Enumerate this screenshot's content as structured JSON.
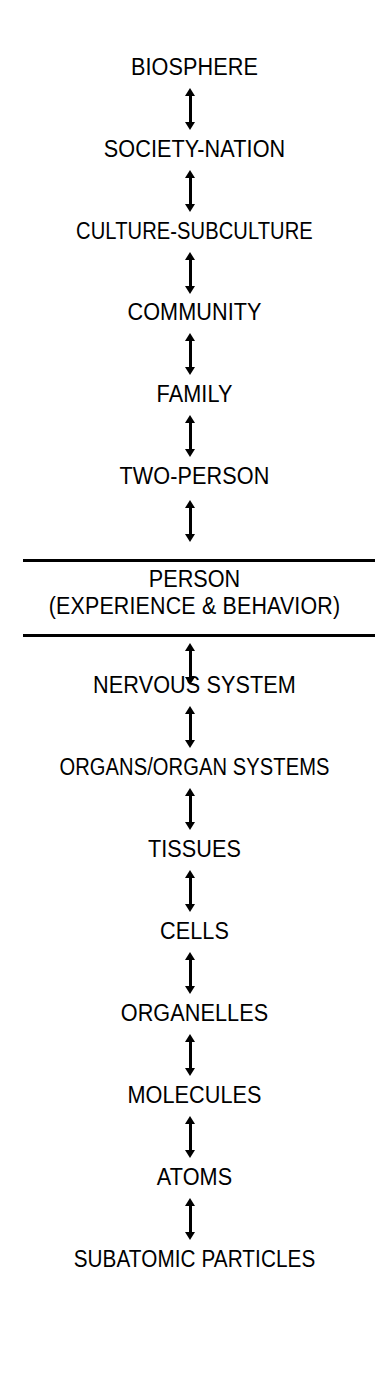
{
  "diagram": {
    "background_color": "#ffffff",
    "ink_color": "#000000",
    "orientation": "vertical",
    "connector": "double-headed-arrow",
    "levels": [
      {
        "id": "biosphere",
        "label": "BIOSPHERE",
        "tier": "supra-personal",
        "rank": 1,
        "top": 54
      },
      {
        "id": "society-nation",
        "label": "SOCIETY-NATION",
        "tier": "supra-personal",
        "rank": 2,
        "top": 136
      },
      {
        "id": "culture-subculture",
        "label": "CULTURE-SUBCULTURE",
        "tier": "supra-personal",
        "rank": 3,
        "top": 218
      },
      {
        "id": "community",
        "label": "COMMUNITY",
        "tier": "supra-personal",
        "rank": 4,
        "top": 299
      },
      {
        "id": "family",
        "label": "FAMILY",
        "tier": "supra-personal",
        "rank": 5,
        "top": 381
      },
      {
        "id": "two-person",
        "label": "TWO-PERSON",
        "tier": "supra-personal",
        "rank": 6,
        "top": 463
      },
      {
        "id": "nervous-system",
        "label": "NERVOUS SYSTEM",
        "tier": "sub-personal",
        "rank": 8,
        "top": 672
      },
      {
        "id": "organs-organ-systems",
        "label": "ORGANS/ORGAN SYSTEMS",
        "tier": "sub-personal",
        "rank": 9,
        "top": 754
      },
      {
        "id": "tissues",
        "label": "TISSUES",
        "tier": "sub-personal",
        "rank": 10,
        "top": 836
      },
      {
        "id": "cells",
        "label": "CELLS",
        "tier": "sub-personal",
        "rank": 11,
        "top": 918
      },
      {
        "id": "organelles",
        "label": "ORGANELLES",
        "tier": "sub-personal",
        "rank": 12,
        "top": 1000
      },
      {
        "id": "molecules",
        "label": "MOLECULES",
        "tier": "sub-personal",
        "rank": 13,
        "top": 1082
      },
      {
        "id": "atoms",
        "label": "ATOMS",
        "tier": "sub-personal",
        "rank": 14,
        "top": 1164
      },
      {
        "id": "subatomic-particles",
        "label": "SUBATOMIC PARTICLES",
        "tier": "sub-personal",
        "rank": 15,
        "top": 1246
      }
    ],
    "focal_level": {
      "id": "person",
      "rank": 7,
      "line_1": "PERSON",
      "line_2": "(EXPERIENCE & BEHAVIOR)",
      "rule_top_y": 559,
      "rule_bottom_y": 634
    },
    "arrows": [
      {
        "id": "arrow-biosphere-society",
        "top": 88,
        "height": 42
      },
      {
        "id": "arrow-society-culture",
        "top": 170,
        "height": 42
      },
      {
        "id": "arrow-culture-community",
        "top": 252,
        "height": 42
      },
      {
        "id": "arrow-community-family",
        "top": 333,
        "height": 42
      },
      {
        "id": "arrow-family-twoperson",
        "top": 415,
        "height": 42
      },
      {
        "id": "arrow-twoperson-person",
        "top": 500,
        "height": 42
      },
      {
        "id": "arrow-person-nervous",
        "top": 643,
        "height": 42
      },
      {
        "id": "arrow-nervous-organs",
        "top": 706,
        "height": 42
      },
      {
        "id": "arrow-organs-tissues",
        "top": 788,
        "height": 42
      },
      {
        "id": "arrow-tissues-cells",
        "top": 870,
        "height": 42
      },
      {
        "id": "arrow-cells-organelles",
        "top": 952,
        "height": 42
      },
      {
        "id": "arrow-organelles-molecules",
        "top": 1034,
        "height": 42
      },
      {
        "id": "arrow-molecules-atoms",
        "top": 1116,
        "height": 42
      },
      {
        "id": "arrow-atoms-subatomic",
        "top": 1198,
        "height": 42
      }
    ]
  }
}
